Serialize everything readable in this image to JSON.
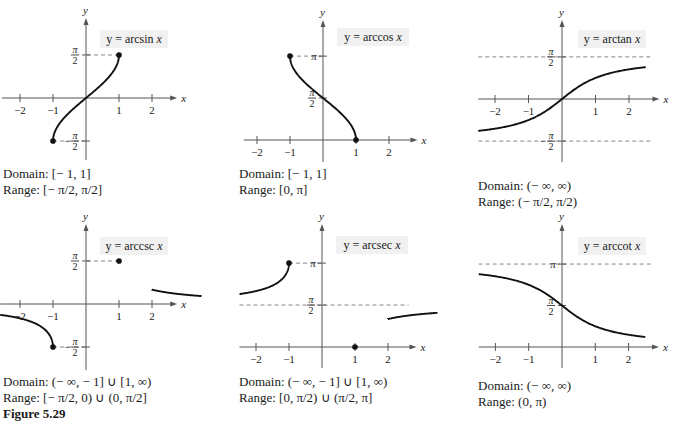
{
  "figure_label": "Figure 5.29",
  "chart_data": [
    {
      "type": "line",
      "id": "arcsin",
      "title": "y = arcsin x",
      "func": "arcsin",
      "xlabel": "x",
      "ylabel": "y",
      "x_ticks": [
        -2,
        -1,
        1,
        2
      ],
      "y_ticks": [
        {
          "label_num": "π",
          "label_den": "2",
          "value": 1.5708,
          "sign": ""
        },
        {
          "label_num": "π",
          "label_den": "2",
          "value": -1.5708,
          "sign": "−"
        }
      ],
      "domain_plot": [
        [
          -1,
          1
        ]
      ],
      "endpoints": [
        [
          -1,
          -1.5708
        ],
        [
          1,
          1.5708
        ]
      ],
      "asymptotes": [],
      "guides": [
        [
          -1,
          -1.5708
        ],
        [
          1,
          1.5708
        ]
      ],
      "domain_text": "Domain: [− 1, 1]",
      "range_text": "Range: [− π/2, π/2]",
      "origin": [
        86,
        98
      ],
      "unit_x": 33,
      "unit_y": 27.4,
      "xlim": [
        -2.55,
        2.4
      ],
      "ylim_px": [
        22,
        160
      ],
      "label_pos": [
        100,
        30,
        68,
        18
      ],
      "caption_pos": [
        3,
        166
      ]
    },
    {
      "type": "line",
      "id": "arccos",
      "title": "y = arccos x",
      "func": "arccos",
      "xlabel": "x",
      "ylabel": "y",
      "x_ticks": [
        -2,
        -1,
        1,
        2
      ],
      "y_ticks": [
        {
          "label_num": "π",
          "label_den": "",
          "value": 3.1416,
          "sign": ""
        },
        {
          "label_num": "π",
          "label_den": "2",
          "value": 1.5708,
          "sign": ""
        }
      ],
      "domain_plot": [
        [
          -1,
          1
        ]
      ],
      "endpoints": [
        [
          -1,
          3.1416
        ],
        [
          1,
          0
        ]
      ],
      "asymptotes": [],
      "guides": [
        [
          -1,
          3.1416
        ]
      ],
      "domain_text": "Domain: [− 1, 1]",
      "range_text": "Range: [0, π]",
      "origin": [
        323,
        140
      ],
      "unit_x": 33,
      "unit_y": 26.7,
      "xlim": [
        -2.4,
        2.5
      ],
      "ylim_px": [
        24,
        162
      ],
      "label_pos": [
        337,
        28,
        72,
        18
      ],
      "caption_pos": [
        239,
        166
      ]
    },
    {
      "type": "line",
      "id": "arctan",
      "title": "y = arctan x",
      "func": "arctan",
      "xlabel": "x",
      "ylabel": "y",
      "x_ticks": [
        -2,
        -1,
        1,
        2
      ],
      "y_ticks": [
        {
          "label_num": "π",
          "label_den": "2",
          "value": 1.5708,
          "sign": ""
        },
        {
          "label_num": "π",
          "label_den": "2",
          "value": -1.5708,
          "sign": "−"
        }
      ],
      "domain_plot": [
        [
          -2.5,
          2.5
        ]
      ],
      "endpoints": [],
      "asymptotes": [
        1.5708,
        -1.5708
      ],
      "guides": [],
      "domain_text": "Domain: (− ∞, ∞)",
      "range_text": "Range: (− π/2, π/2)",
      "origin": [
        562,
        99
      ],
      "unit_x": 33.5,
      "unit_y": 26.8,
      "xlim": [
        -2.5,
        2.55
      ],
      "ylim_px": [
        24,
        162
      ],
      "label_pos": [
        578,
        30,
        68,
        18
      ],
      "caption_pos": [
        478,
        178
      ]
    },
    {
      "type": "line",
      "id": "arccsc",
      "title": "y = arccsc x",
      "func": "arccsc",
      "xlabel": "x",
      "ylabel": "y",
      "x_ticks": [
        -2,
        -1,
        1,
        2
      ],
      "y_ticks": [
        {
          "label_num": "π",
          "label_den": "2",
          "value": 1.5708,
          "sign": ""
        },
        {
          "label_num": "π",
          "label_den": "2",
          "value": -1.5708,
          "sign": "−"
        }
      ],
      "domain_plot": [
        [
          -2.6,
          -1
        ],
        [
          1,
          2.5
        ]
      ],
      "endpoints": [
        [
          -1,
          -1.5708
        ],
        [
          1,
          1.5708
        ]
      ],
      "asymptotes": [],
      "guides": [
        [
          -1,
          -1.5708
        ],
        [
          1,
          1.5708
        ]
      ],
      "domain_text": "Domain: (− ∞, − 1] ∪ [1, ∞)",
      "range_text": "Range: [− π/2, 0) ∪ (0, π/2]",
      "origin": [
        86,
        304
      ],
      "unit_x": 33,
      "unit_y": 27.4,
      "xlim": [
        -2.6,
        2.4
      ],
      "ylim_px": [
        228,
        370
      ],
      "label_pos": [
        100,
        237,
        68,
        18
      ],
      "caption_pos": [
        3,
        374
      ]
    },
    {
      "type": "line",
      "id": "arcsec",
      "title": "y = arcsec x",
      "func": "arcsec",
      "xlabel": "x",
      "ylabel": "y",
      "x_ticks": [
        -2,
        -1,
        1,
        2
      ],
      "y_ticks": [
        {
          "label_num": "π",
          "label_den": "",
          "value": 3.1416,
          "sign": ""
        },
        {
          "label_num": "π",
          "label_den": "2",
          "value": 1.5708,
          "sign": ""
        }
      ],
      "domain_plot": [
        [
          -2.5,
          -1
        ],
        [
          1,
          2.5
        ]
      ],
      "endpoints": [
        [
          -1,
          3.1416
        ],
        [
          1,
          0
        ]
      ],
      "asymptotes": [
        1.5708
      ],
      "guides": [
        [
          -1,
          3.1416
        ]
      ],
      "domain_text": "Domain: (− ∞, − 1] ∪ [1, ∞)",
      "range_text": "Range: [0, π/2) ∪ (π/2, π]",
      "origin": [
        322,
        347
      ],
      "unit_x": 33,
      "unit_y": 26.7,
      "xlim": [
        -2.5,
        2.5
      ],
      "ylim_px": [
        228,
        368
      ],
      "label_pos": [
        336,
        236,
        72,
        18
      ],
      "caption_pos": [
        239,
        374
      ]
    },
    {
      "type": "line",
      "id": "arccot",
      "title": "y = arccot x",
      "func": "arccot",
      "xlabel": "x",
      "ylabel": "y",
      "x_ticks": [
        -2,
        -1,
        1,
        2
      ],
      "y_ticks": [
        {
          "label_num": "π",
          "label_den": "",
          "value": 3.1416,
          "sign": ""
        },
        {
          "label_num": "π",
          "label_den": "2",
          "value": 1.5708,
          "sign": ""
        }
      ],
      "domain_plot": [
        [
          -2.5,
          2.5
        ]
      ],
      "endpoints": [],
      "asymptotes": [
        3.1416
      ],
      "guides": [],
      "domain_text": "Domain: (− ∞, ∞)",
      "range_text": "Range: (0, π)",
      "origin": [
        562,
        347
      ],
      "unit_x": 33.3,
      "unit_y": 26.4,
      "xlim": [
        -2.5,
        2.55
      ],
      "ylim_px": [
        228,
        368
      ],
      "label_pos": [
        578,
        237,
        68,
        18
      ],
      "caption_pos": [
        478,
        378
      ]
    }
  ],
  "colors": {
    "curve": "#111111",
    "axis": "#555555",
    "dash": "#777777",
    "label_bg": "#f1f1f1",
    "text": "#1a1a1a"
  }
}
